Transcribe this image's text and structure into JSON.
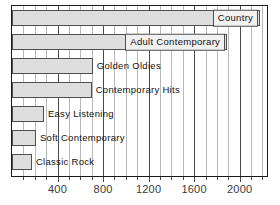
{
  "chart_data": {
    "type": "bar",
    "orientation": "horizontal",
    "title": "",
    "subtitle": "",
    "xlabel": "",
    "ylabel": "",
    "categories": [
      "Country",
      "Adult Contemporary",
      "Golden Oldies",
      "Contemporary Hits",
      "Easy Listening",
      "Soft Contemporary",
      "Classic Rock"
    ],
    "values": [
      2180,
      1890,
      710,
      700,
      280,
      210,
      175
    ],
    "xlim": [
      0,
      2240
    ],
    "tick_labels": [
      "400",
      "800",
      "1200",
      "1600",
      "2000"
    ],
    "tick_values": [
      400,
      800,
      1200,
      1600,
      2000
    ],
    "minor_tick_step": 100,
    "major_tick_step": 400,
    "grid": true,
    "legend": "none",
    "bar_fill_color": "#dedede",
    "bar_edge_color": "#4f4f4f",
    "label_box_color": "#f1f1f1",
    "minor_gridline_color": "#b9b9b9",
    "major_gridline_color": "#4a4a4a",
    "axis_color": "#1a1a1a",
    "bars": [
      {
        "label": "Country",
        "value": 2180,
        "label_style": "inside-box"
      },
      {
        "label": "Adult Contemporary",
        "value": 1890,
        "label_style": "inside-box"
      },
      {
        "label": "Golden Oldies",
        "value": 710,
        "label_style": "outside"
      },
      {
        "label": "Contemporary Hits",
        "value": 700,
        "label_style": "outside"
      },
      {
        "label": "Easy Listening",
        "value": 280,
        "label_style": "outside"
      },
      {
        "label": "Soft Contemporary",
        "value": 210,
        "label_style": "outside"
      },
      {
        "label": "Classic Rock",
        "value": 175,
        "label_style": "outside"
      }
    ]
  }
}
